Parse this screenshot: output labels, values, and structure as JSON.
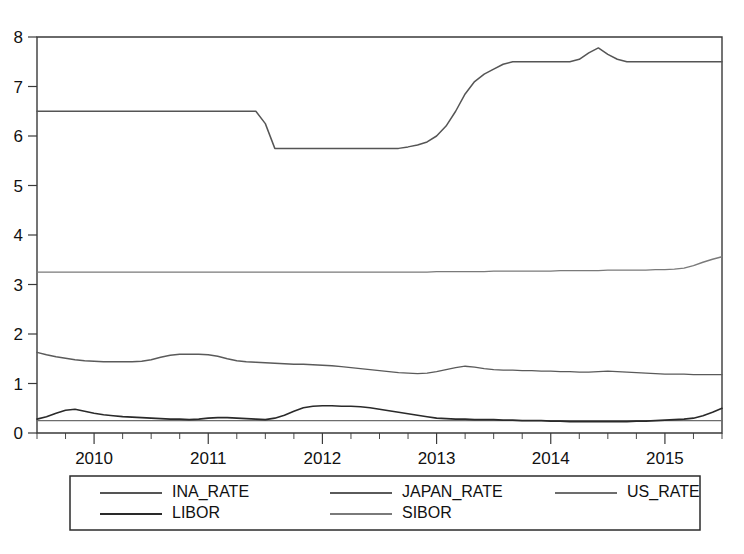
{
  "chart_data": {
    "type": "line",
    "title": "",
    "subtitle": "",
    "xlabel": "",
    "ylabel": "",
    "xlim": [
      2009.5,
      2015.5
    ],
    "ylim": [
      0,
      8
    ],
    "yticks": [
      0,
      1,
      2,
      3,
      4,
      5,
      6,
      7,
      8
    ],
    "xticks": [
      2010,
      2011,
      2012,
      2013,
      2014,
      2015
    ],
    "xtick_labels": [
      "2010",
      "2011",
      "2012",
      "2013",
      "2014",
      "2015"
    ],
    "minor_ticks_per_interval": 4,
    "grid": false,
    "legend_position": "bottom",
    "x": [
      2009.5,
      2009.583,
      2009.667,
      2009.75,
      2009.833,
      2009.917,
      2010.0,
      2010.083,
      2010.167,
      2010.25,
      2010.333,
      2010.417,
      2010.5,
      2010.583,
      2010.667,
      2010.75,
      2010.833,
      2010.917,
      2011.0,
      2011.083,
      2011.167,
      2011.25,
      2011.333,
      2011.417,
      2011.5,
      2011.583,
      2011.667,
      2011.75,
      2011.833,
      2011.917,
      2012.0,
      2012.083,
      2012.167,
      2012.25,
      2012.333,
      2012.417,
      2012.5,
      2012.583,
      2012.667,
      2012.75,
      2012.833,
      2012.917,
      2013.0,
      2013.083,
      2013.167,
      2013.25,
      2013.333,
      2013.417,
      2013.5,
      2013.583,
      2013.667,
      2013.75,
      2013.833,
      2013.917,
      2014.0,
      2014.083,
      2014.167,
      2014.25,
      2014.333,
      2014.417,
      2014.5,
      2014.583,
      2014.667,
      2014.75,
      2014.833,
      2014.917,
      2015.0,
      2015.083,
      2015.167,
      2015.25,
      2015.333,
      2015.417,
      2015.5
    ],
    "series": [
      {
        "name": "INA_RATE",
        "color": "#555555",
        "width": 1.5,
        "values": [
          6.5,
          6.5,
          6.5,
          6.5,
          6.5,
          6.5,
          6.5,
          6.5,
          6.5,
          6.5,
          6.5,
          6.5,
          6.5,
          6.5,
          6.5,
          6.5,
          6.5,
          6.5,
          6.5,
          6.5,
          6.5,
          6.5,
          6.5,
          6.5,
          6.25,
          5.75,
          5.75,
          5.75,
          5.75,
          5.75,
          5.75,
          5.75,
          5.75,
          5.75,
          5.75,
          5.75,
          5.75,
          5.75,
          5.75,
          5.78,
          5.82,
          5.88,
          6.0,
          6.2,
          6.5,
          6.85,
          7.1,
          7.25,
          7.35,
          7.45,
          7.5,
          7.5,
          7.5,
          7.5,
          7.5,
          7.5,
          7.5,
          7.55,
          7.68,
          7.78,
          7.65,
          7.55,
          7.5,
          7.5,
          7.5,
          7.5,
          7.5,
          7.5,
          7.5,
          7.5,
          7.5,
          7.5,
          7.5
        ]
      },
      {
        "name": "JAPAN_RATE",
        "color": "#5a5a5a",
        "width": 1.4,
        "values": [
          1.63,
          1.58,
          1.54,
          1.51,
          1.48,
          1.46,
          1.45,
          1.44,
          1.44,
          1.44,
          1.44,
          1.45,
          1.48,
          1.53,
          1.57,
          1.59,
          1.59,
          1.59,
          1.58,
          1.55,
          1.5,
          1.46,
          1.44,
          1.43,
          1.42,
          1.41,
          1.4,
          1.39,
          1.39,
          1.38,
          1.37,
          1.36,
          1.34,
          1.32,
          1.3,
          1.28,
          1.26,
          1.24,
          1.22,
          1.21,
          1.2,
          1.21,
          1.24,
          1.28,
          1.32,
          1.35,
          1.33,
          1.3,
          1.28,
          1.27,
          1.27,
          1.26,
          1.26,
          1.25,
          1.25,
          1.24,
          1.24,
          1.23,
          1.23,
          1.24,
          1.25,
          1.24,
          1.23,
          1.22,
          1.21,
          1.2,
          1.19,
          1.19,
          1.19,
          1.18,
          1.18,
          1.18,
          1.18
        ]
      },
      {
        "name": "US_RATE",
        "color": "#6d6d6d",
        "width": 1.3,
        "values": [
          0.25,
          0.25,
          0.25,
          0.25,
          0.25,
          0.25,
          0.25,
          0.25,
          0.25,
          0.25,
          0.25,
          0.25,
          0.25,
          0.25,
          0.25,
          0.25,
          0.25,
          0.25,
          0.25,
          0.25,
          0.25,
          0.25,
          0.25,
          0.25,
          0.25,
          0.25,
          0.25,
          0.25,
          0.25,
          0.25,
          0.25,
          0.25,
          0.25,
          0.25,
          0.25,
          0.25,
          0.25,
          0.25,
          0.25,
          0.25,
          0.25,
          0.25,
          0.25,
          0.25,
          0.25,
          0.25,
          0.25,
          0.25,
          0.25,
          0.25,
          0.25,
          0.25,
          0.25,
          0.25,
          0.25,
          0.25,
          0.25,
          0.25,
          0.25,
          0.25,
          0.25,
          0.25,
          0.25,
          0.25,
          0.25,
          0.25,
          0.25,
          0.25,
          0.25,
          0.25,
          0.25,
          0.25,
          0.25
        ]
      },
      {
        "name": "LIBOR",
        "color": "#2a2a2a",
        "width": 1.6,
        "values": [
          0.28,
          0.33,
          0.4,
          0.46,
          0.48,
          0.44,
          0.4,
          0.37,
          0.35,
          0.33,
          0.32,
          0.31,
          0.3,
          0.29,
          0.28,
          0.28,
          0.27,
          0.28,
          0.3,
          0.31,
          0.31,
          0.3,
          0.29,
          0.28,
          0.27,
          0.3,
          0.36,
          0.44,
          0.51,
          0.54,
          0.55,
          0.55,
          0.54,
          0.54,
          0.53,
          0.51,
          0.48,
          0.45,
          0.42,
          0.39,
          0.36,
          0.33,
          0.3,
          0.29,
          0.28,
          0.28,
          0.27,
          0.27,
          0.27,
          0.26,
          0.26,
          0.25,
          0.25,
          0.25,
          0.24,
          0.24,
          0.23,
          0.23,
          0.23,
          0.23,
          0.23,
          0.23,
          0.23,
          0.24,
          0.24,
          0.25,
          0.26,
          0.27,
          0.28,
          0.3,
          0.35,
          0.42,
          0.5
        ]
      },
      {
        "name": "SIBOR",
        "color": "#7a7a7a",
        "width": 1.4,
        "values": [
          3.25,
          3.25,
          3.25,
          3.25,
          3.25,
          3.25,
          3.25,
          3.25,
          3.25,
          3.25,
          3.25,
          3.25,
          3.25,
          3.25,
          3.25,
          3.25,
          3.25,
          3.25,
          3.25,
          3.25,
          3.25,
          3.25,
          3.25,
          3.25,
          3.25,
          3.25,
          3.25,
          3.25,
          3.25,
          3.25,
          3.25,
          3.25,
          3.25,
          3.25,
          3.25,
          3.25,
          3.25,
          3.25,
          3.25,
          3.25,
          3.25,
          3.25,
          3.26,
          3.26,
          3.26,
          3.26,
          3.26,
          3.26,
          3.27,
          3.27,
          3.27,
          3.27,
          3.27,
          3.27,
          3.27,
          3.28,
          3.28,
          3.28,
          3.28,
          3.28,
          3.29,
          3.29,
          3.29,
          3.29,
          3.29,
          3.3,
          3.3,
          3.31,
          3.33,
          3.38,
          3.45,
          3.51,
          3.56
        ]
      }
    ]
  },
  "legend": {
    "entries": [
      {
        "label": "INA_RATE",
        "color": "#555555"
      },
      {
        "label": "JAPAN_RATE",
        "color": "#5a5a5a"
      },
      {
        "label": "US_RATE",
        "color": "#6d6d6d"
      },
      {
        "label": "LIBOR",
        "color": "#2a2a2a"
      },
      {
        "label": "SIBOR",
        "color": "#7a7a7a"
      }
    ]
  },
  "style": {
    "background": "#ffffff",
    "axis_color": "#3a3a3a",
    "text_color": "#111111",
    "legend_border": "#2b2b2b"
  }
}
